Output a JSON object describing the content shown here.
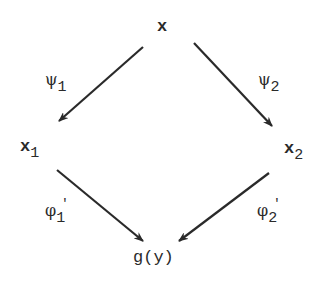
{
  "diagram": {
    "nodes": {
      "top": {
        "text": "x"
      },
      "left": {
        "text": "x",
        "sub": "1"
      },
      "right": {
        "text": "x",
        "sub": "2"
      },
      "bottom": {
        "text": "g(y)"
      }
    },
    "edges": {
      "psi1": {
        "symbol": "ψ",
        "sub": "1",
        "from": "x",
        "to": "x1"
      },
      "psi2": {
        "symbol": "ψ",
        "sub": "2",
        "from": "x",
        "to": "x2"
      },
      "phi1": {
        "symbol": "φ",
        "sub": "1",
        "prime": "'",
        "from": "x1",
        "to": "g(y)"
      },
      "phi2": {
        "symbol": "φ",
        "sub": "2",
        "prime": "'",
        "from": "x2",
        "to": "g(y)"
      }
    },
    "colors": {
      "ink": "#2a2a2a",
      "background": "#ffffff"
    }
  }
}
